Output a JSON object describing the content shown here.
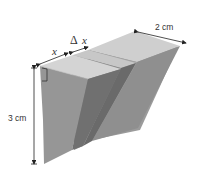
{
  "figure": {
    "labels": {
      "height": "3 cm",
      "depth": "2 cm",
      "slice_position": "x",
      "slice_delta": "Δ",
      "slice_delta_var": "x"
    },
    "colors": {
      "top_face": "#cfcfcf",
      "front_face": "#8d8d8d",
      "side_face": "#9a9a9a",
      "slot": "#6a6a6a",
      "dimension_line": "#222222"
    }
  }
}
